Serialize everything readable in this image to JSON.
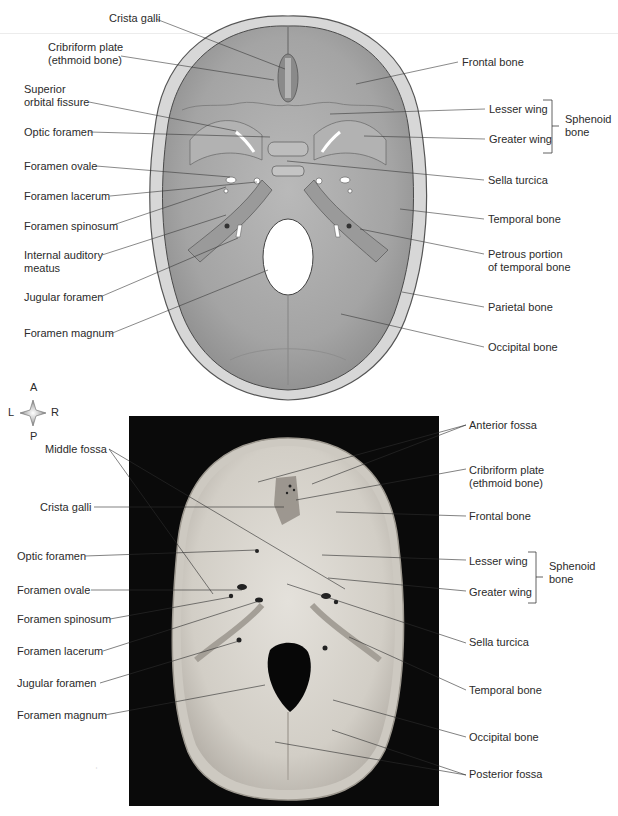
{
  "figure": {
    "top_panel": {
      "type": "illustration",
      "view": "superior view of cranial floor",
      "left_labels": [
        {
          "id": "crista-galli",
          "text": "Crista galli",
          "x": 109,
          "y": 12
        },
        {
          "id": "cribriform-plate",
          "text": "Cribriform plate\n(ethmoid bone)",
          "x": 48,
          "y": 41
        },
        {
          "id": "superior-orbital-fissure",
          "text": "Superior\norbital fissure",
          "x": 24,
          "y": 83
        },
        {
          "id": "optic-foramen",
          "text": "Optic foramen",
          "x": 24,
          "y": 126
        },
        {
          "id": "foramen-ovale",
          "text": "Foramen ovale",
          "x": 24,
          "y": 160
        },
        {
          "id": "foramen-lacerum",
          "text": "Foramen lacerum",
          "x": 24,
          "y": 190
        },
        {
          "id": "foramen-spinosum",
          "text": "Foramen spinosum",
          "x": 24,
          "y": 220
        },
        {
          "id": "internal-auditory-meatus",
          "text": "Internal auditory\nmeatus",
          "x": 24,
          "y": 249
        },
        {
          "id": "jugular-foramen",
          "text": "Jugular foramen",
          "x": 24,
          "y": 291
        },
        {
          "id": "foramen-magnum",
          "text": "Foramen magnum",
          "x": 24,
          "y": 327
        }
      ],
      "right_labels": [
        {
          "id": "frontal-bone",
          "text": "Frontal bone",
          "x": 462,
          "y": 56
        },
        {
          "id": "lesser-wing",
          "text": "Lesser wing",
          "x": 489,
          "y": 103
        },
        {
          "id": "greater-wing",
          "text": "Greater wing",
          "x": 489,
          "y": 133
        },
        {
          "id": "sella-turcica",
          "text": "Sella turcica",
          "x": 488,
          "y": 174
        },
        {
          "id": "temporal-bone",
          "text": "Temporal bone",
          "x": 488,
          "y": 213
        },
        {
          "id": "petrous-portion",
          "text": "Petrous portion\nof temporal bone",
          "x": 488,
          "y": 248
        },
        {
          "id": "parietal-bone",
          "text": "Parietal bone",
          "x": 488,
          "y": 301
        },
        {
          "id": "occipital-bone",
          "text": "Occipital bone",
          "x": 488,
          "y": 341
        }
      ],
      "bracket": {
        "text": "Sphenoid\nbone",
        "x": 565,
        "y": 118
      }
    },
    "orientation": {
      "anterior": "A",
      "posterior": "P",
      "left": "L",
      "right": "R"
    },
    "bottom_panel": {
      "type": "photograph",
      "view": "superior view of cranial floor (dried skull)",
      "left_labels": [
        {
          "id": "middle-fossa",
          "text": "Middle fossa",
          "x": 45,
          "y": 443
        },
        {
          "id": "crista-galli",
          "text": "Crista galli",
          "x": 40,
          "y": 501
        },
        {
          "id": "optic-foramen",
          "text": "Optic foramen",
          "x": 17,
          "y": 550
        },
        {
          "id": "foramen-ovale",
          "text": "Foramen ovale",
          "x": 17,
          "y": 584
        },
        {
          "id": "foramen-spinosum",
          "text": "Foramen spinosum",
          "x": 17,
          "y": 613
        },
        {
          "id": "foramen-lacerum",
          "text": "Foramen lacerum",
          "x": 17,
          "y": 645
        },
        {
          "id": "jugular-foramen",
          "text": "Jugular foramen",
          "x": 17,
          "y": 677
        },
        {
          "id": "foramen-magnum",
          "text": "Foramen magnum",
          "x": 17,
          "y": 709
        }
      ],
      "right_labels": [
        {
          "id": "anterior-fossa",
          "text": "Anterior fossa",
          "x": 469,
          "y": 419
        },
        {
          "id": "cribriform-plate",
          "text": "Cribriform plate\n(ethmoid bone)",
          "x": 469,
          "y": 464
        },
        {
          "id": "frontal-bone",
          "text": "Frontal bone",
          "x": 469,
          "y": 510
        },
        {
          "id": "lesser-wing",
          "text": "Lesser wing",
          "x": 469,
          "y": 555
        },
        {
          "id": "greater-wing",
          "text": "Greater wing",
          "x": 469,
          "y": 586
        },
        {
          "id": "sella-turcica",
          "text": "Sella turcica",
          "x": 469,
          "y": 636
        },
        {
          "id": "temporal-bone",
          "text": "Temporal bone",
          "x": 469,
          "y": 684
        },
        {
          "id": "occipital-bone",
          "text": "Occipital bone",
          "x": 469,
          "y": 731
        },
        {
          "id": "posterior-fossa",
          "text": "Posterior fossa",
          "x": 469,
          "y": 768
        }
      ],
      "bracket": {
        "text": "Sphenoid\nbone",
        "x": 549,
        "y": 565
      }
    }
  },
  "colors": {
    "bone_fill": "#a9a9a9",
    "bone_light": "#c8c8c8",
    "bone_dark": "#8e8e8e",
    "rim": "#d8d8d8",
    "photo_bg": "#0a0a0a",
    "photo_bone": "#d9d6d0",
    "leader": "#3a3a3a",
    "text": "#2b2b2b"
  }
}
